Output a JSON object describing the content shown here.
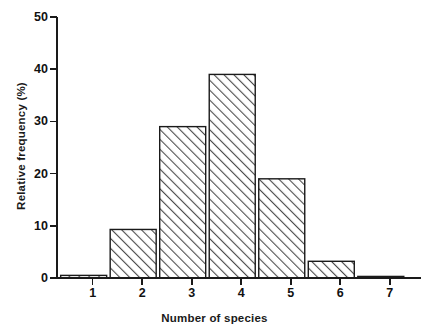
{
  "chart_data": {
    "type": "bar",
    "title": "",
    "subtitle": "",
    "xlabel": "Number of species",
    "ylabel": "Relative frequency (%)",
    "categories": [
      "1",
      "2",
      "3",
      "4",
      "5",
      "6",
      "7"
    ],
    "values": [
      0.5,
      9.3,
      29.0,
      39.0,
      19.0,
      3.2,
      0.3
    ],
    "series": [
      {
        "name": "Relative frequency",
        "values": [
          0.5,
          9.3,
          29.0,
          39.0,
          19.0,
          3.2,
          0.3
        ]
      }
    ],
    "ylim": [
      0,
      50
    ],
    "yticks": [
      0,
      10,
      20,
      30,
      40,
      50
    ],
    "ytick_labels": [
      "0",
      "10",
      "20",
      "30",
      "40",
      "50"
    ],
    "xticks": [
      1,
      2,
      3,
      4,
      5,
      6,
      7
    ],
    "xtick_labels": [
      "1",
      "2",
      "3",
      "4",
      "5",
      "6",
      "7"
    ],
    "grid": false,
    "legend": null,
    "legend_position": "none",
    "bar_fill": "hatch-forward-diagonal",
    "bar_edge_color": "#1a1a1a",
    "bar_fill_color": "#ffffff",
    "hatch_color": "#4d4d4d",
    "axis_color": "#1a1a1a",
    "background_color": "#ffffff",
    "annotations": []
  },
  "axes": {
    "y_title": "Relative frequency (%)",
    "x_title": "Number of species"
  },
  "ticks": {
    "y": [
      "50",
      "40",
      "30",
      "20",
      "10",
      "0"
    ],
    "x": [
      "1",
      "2",
      "3",
      "4",
      "5",
      "6",
      "7"
    ]
  }
}
